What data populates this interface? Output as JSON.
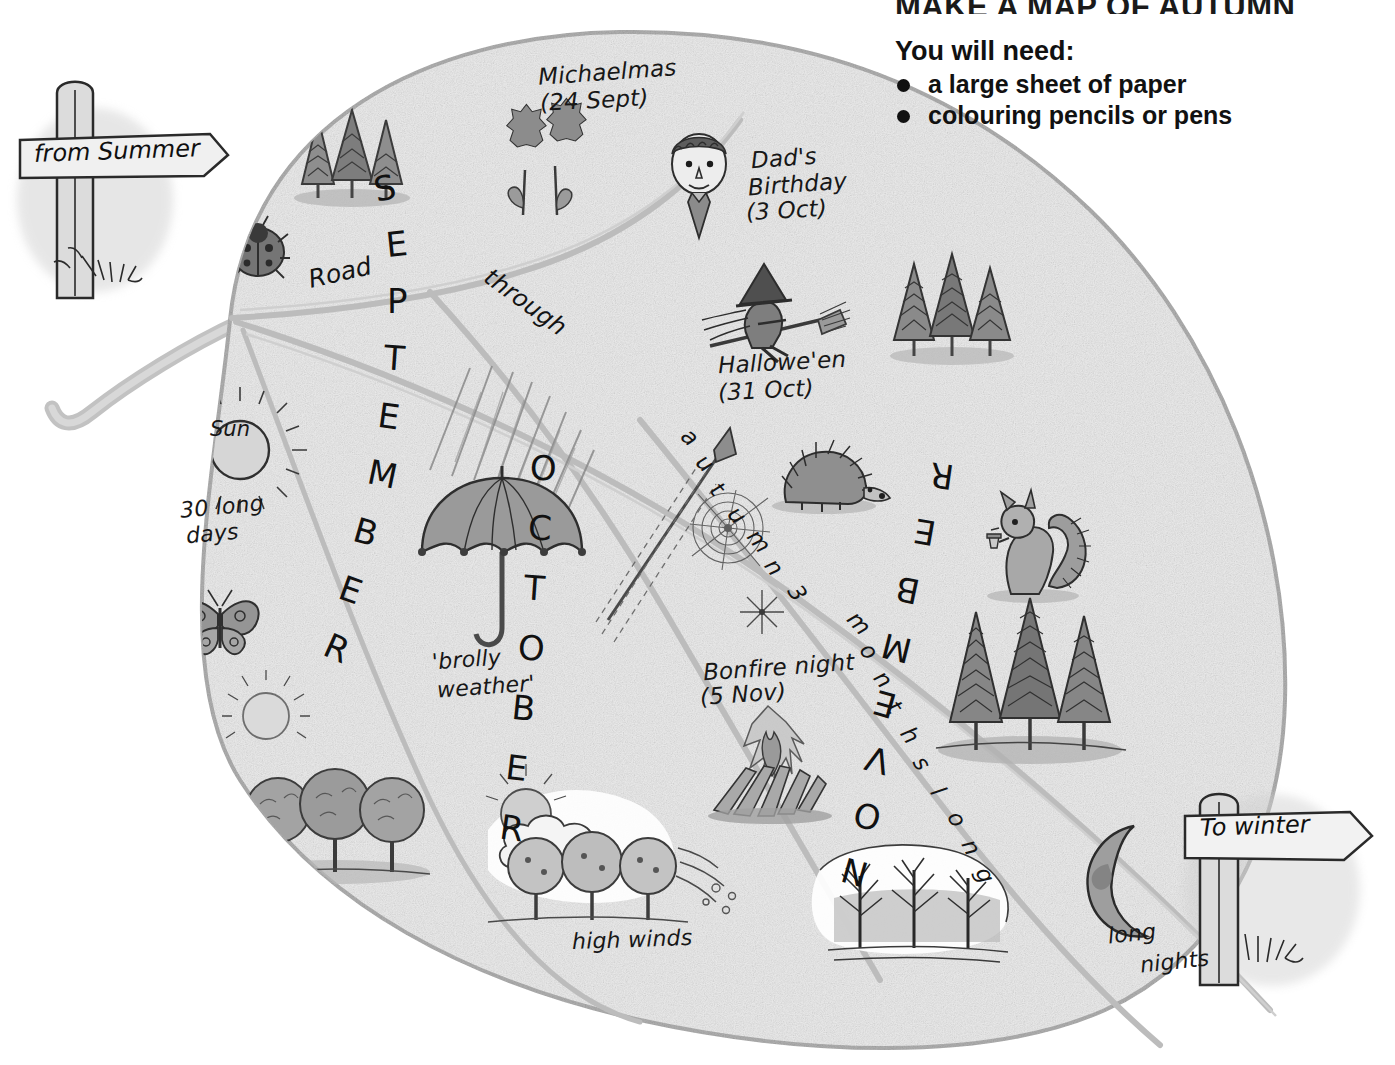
{
  "page": {
    "title": "MAKE A MAP OF AUTUMN",
    "you_will_need_label": "You will need:",
    "materials": [
      "a large sheet of paper",
      "colouring pencils or pens"
    ]
  },
  "signposts": {
    "from": "from Summer",
    "to": "To winter"
  },
  "road": {
    "word1": "Road",
    "word2": "through",
    "word3": "autumn 3 months long",
    "autumn_letters": [
      "a",
      "u",
      "t",
      "u",
      "m",
      "n",
      " ",
      "3"
    ],
    "months_letters": [
      "m",
      "o",
      "n",
      "t",
      "h",
      "s",
      " ",
      "l",
      "o",
      "n",
      "g"
    ]
  },
  "months": [
    {
      "name": "SEPTEMBER",
      "letters": [
        "S",
        "E",
        "P",
        "T",
        "E",
        "M",
        "B",
        "E",
        "R"
      ]
    },
    {
      "name": "OCTOBER",
      "letters": [
        "O",
        "C",
        "T",
        "O",
        "B",
        "E",
        "R"
      ]
    },
    {
      "name": "NOVEMBER",
      "letters": [
        "N",
        "O",
        "V",
        "E",
        "M",
        "B",
        "E",
        "R"
      ]
    }
  ],
  "events": [
    {
      "name": "Michaelmas",
      "date": "(24 Sept)"
    },
    {
      "name": "Dad's",
      "name2": "Birthday",
      "date": "(3 Oct)"
    },
    {
      "name": "Hallowe'en",
      "date": "(31 Oct)"
    },
    {
      "name": "Bonfire night",
      "date": "(5 Nov)"
    }
  ],
  "annotations": {
    "sun": "Sun",
    "thirty_days_line1": "30 long",
    "thirty_days_line2": "days",
    "brolly_line1": "'brolly",
    "brolly_line2": "weather'",
    "high_winds": "high winds",
    "long_nights_line1": "long",
    "long_nights_line2": "nights"
  },
  "icons": {
    "fir_trees": "fir-trees-icon",
    "flowers": "flowers-icon",
    "ladybird": "ladybird-icon",
    "dad_face": "dad-face-icon",
    "witch": "witch-on-broomstick-icon",
    "sun_rays": "sun-with-rays-icon",
    "butterfly": "butterfly-icon",
    "hazy_sun": "hazy-sun-icon",
    "autumn_trees": "autumn-trees-icon",
    "umbrella": "umbrella-icon",
    "rain": "rain-icon",
    "windy_trees": "windy-trees-icon",
    "hedgehog": "hedgehog-icon",
    "spider_web": "spider-web-icon",
    "firework": "firework-icon",
    "rocket": "rocket-icon",
    "bonfire": "bonfire-icon",
    "squirrel": "squirrel-icon",
    "conifers": "conifer-trees-icon",
    "bare_trees": "bare-trees-icon",
    "moon": "crescent-moon-icon"
  },
  "colors": {
    "leaf_fill": "#e9e9e9",
    "leaf_fill_light": "#efefef",
    "vein": "#b9b9b9",
    "outline": "#a8a8a8",
    "ink": "#151515",
    "mid_grey": "#9a9a9a",
    "dark_grey": "#6e6e6e",
    "background": "#ffffff"
  }
}
